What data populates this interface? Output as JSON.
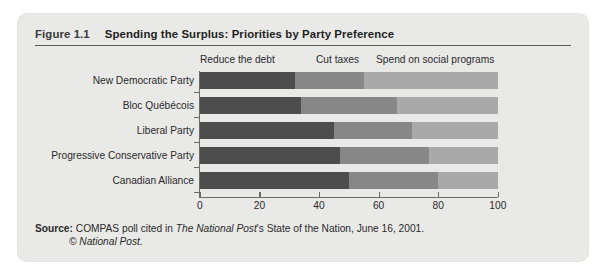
{
  "figure": {
    "number": "Figure 1.1",
    "title": "Spending the Surplus: Priorities by Party Preference"
  },
  "source": {
    "label": "Source:",
    "text_a": " COMPAS poll cited in ",
    "italic_a": "The National Post",
    "text_b": "'s State of the Nation, June 16, 2001.",
    "line2_italic": "© National Post."
  },
  "chart_data": {
    "type": "bar",
    "orientation": "horizontal",
    "stacked": true,
    "title": "Spending the Surplus: Priorities by Party Preference",
    "xlabel": "",
    "ylabel": "",
    "xlim": [
      0,
      100
    ],
    "xticks": [
      0,
      20,
      40,
      60,
      80,
      100
    ],
    "xticklabels": [
      "0",
      "20",
      "40",
      "60",
      "80",
      "100"
    ],
    "grid": false,
    "legend_position": "top",
    "categories": [
      "New Democratic Party",
      "Bloc Québécois",
      "Liberal Party",
      "Progressive Conservative Party",
      "Canadian Alliance"
    ],
    "series": [
      {
        "name": "Reduce the debt",
        "color": "#4d4d4d",
        "values": [
          32,
          34,
          45,
          47,
          50
        ]
      },
      {
        "name": "Cut taxes",
        "color": "#878787",
        "values": [
          23,
          32,
          26,
          30,
          30
        ]
      },
      {
        "name": "Spend on social programs",
        "color": "#a9a9a9",
        "values": [
          45,
          34,
          29,
          23,
          20
        ]
      }
    ]
  }
}
